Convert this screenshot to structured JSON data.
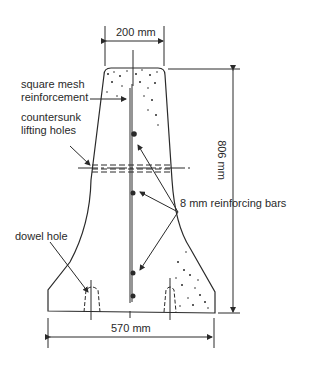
{
  "diagram": {
    "dimensions": {
      "top_width": "200 mm",
      "height": "806 mm",
      "base_width": "570 mm"
    },
    "labels": {
      "mesh": "square mesh\nreinforcement",
      "mesh_line1": "square mesh",
      "mesh_line2": "reinforcement",
      "lifting_line1": "countersunk",
      "lifting_line2": "lifting holes",
      "bars": "8 mm reinforcing bars",
      "dowel": "dowel hole"
    },
    "colors": {
      "ink": "#2a2a2a",
      "background": "#ffffff"
    }
  }
}
